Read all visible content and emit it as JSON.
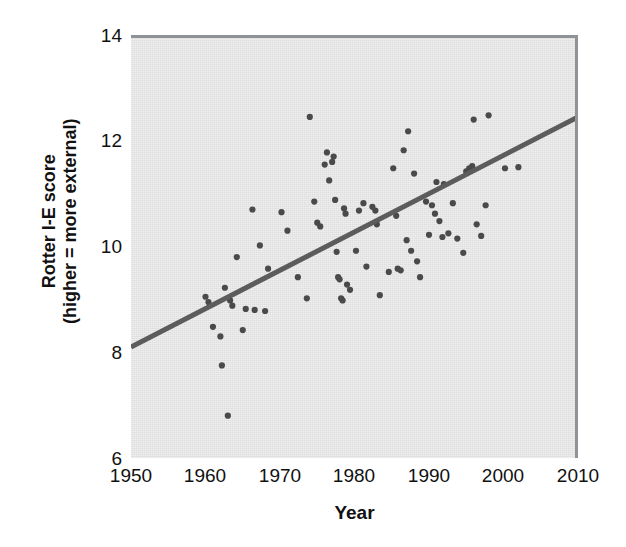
{
  "chart_data": {
    "type": "scatter",
    "title": "",
    "xlabel": "Year",
    "ylabel_line1": "Rotter I-E score",
    "ylabel_line2": "(higher = more external)",
    "xlim": [
      1950,
      2010
    ],
    "ylim": [
      6,
      14
    ],
    "xticks": [
      1950,
      1960,
      1970,
      1980,
      1990,
      2000,
      2010
    ],
    "yticks": [
      6,
      8,
      10,
      12,
      14
    ],
    "grid": false,
    "legend": "none",
    "background_color": "#e7e7e7",
    "point_color": "#4a4a4a",
    "trendline_color": "#5c5c5c",
    "trendline": {
      "type": "linear",
      "x_start": 1950,
      "y_start": 8.1,
      "x_end": 2010,
      "y_end": 12.45
    },
    "series": [
      {
        "name": "Rotter I-E score by year",
        "points": [
          [
            1960.0,
            9.05
          ],
          [
            1960.4,
            8.95
          ],
          [
            1961.0,
            8.48
          ],
          [
            1962.0,
            8.3
          ],
          [
            1962.2,
            7.75
          ],
          [
            1962.6,
            9.22
          ],
          [
            1963.0,
            6.8
          ],
          [
            1963.3,
            8.98
          ],
          [
            1963.6,
            8.88
          ],
          [
            1964.2,
            9.8
          ],
          [
            1965.0,
            8.42
          ],
          [
            1965.4,
            8.82
          ],
          [
            1966.3,
            10.7
          ],
          [
            1966.6,
            8.8
          ],
          [
            1967.3,
            10.02
          ],
          [
            1968.0,
            8.78
          ],
          [
            1968.4,
            9.58
          ],
          [
            1970.2,
            10.65
          ],
          [
            1971.0,
            10.3
          ],
          [
            1972.4,
            9.42
          ],
          [
            1973.6,
            9.02
          ],
          [
            1974.0,
            12.45
          ],
          [
            1974.6,
            10.85
          ],
          [
            1975.0,
            10.45
          ],
          [
            1975.4,
            10.38
          ],
          [
            1976.0,
            11.55
          ],
          [
            1976.3,
            11.78
          ],
          [
            1976.6,
            11.25
          ],
          [
            1977.0,
            11.6
          ],
          [
            1977.2,
            11.7
          ],
          [
            1977.4,
            10.88
          ],
          [
            1977.6,
            9.9
          ],
          [
            1977.8,
            9.42
          ],
          [
            1978.0,
            9.38
          ],
          [
            1978.2,
            9.02
          ],
          [
            1978.4,
            8.98
          ],
          [
            1978.6,
            10.72
          ],
          [
            1978.8,
            10.62
          ],
          [
            1979.0,
            9.28
          ],
          [
            1979.4,
            9.18
          ],
          [
            1980.2,
            9.92
          ],
          [
            1980.6,
            10.68
          ],
          [
            1981.2,
            10.82
          ],
          [
            1981.6,
            9.62
          ],
          [
            1982.4,
            10.75
          ],
          [
            1982.8,
            10.68
          ],
          [
            1983.0,
            10.42
          ],
          [
            1983.4,
            9.08
          ],
          [
            1984.6,
            9.52
          ],
          [
            1985.2,
            11.48
          ],
          [
            1985.6,
            10.58
          ],
          [
            1985.8,
            9.58
          ],
          [
            1986.2,
            9.55
          ],
          [
            1986.6,
            11.82
          ],
          [
            1987.0,
            10.12
          ],
          [
            1987.2,
            12.18
          ],
          [
            1987.6,
            9.92
          ],
          [
            1988.0,
            11.38
          ],
          [
            1988.4,
            9.72
          ],
          [
            1988.8,
            9.42
          ],
          [
            1989.6,
            10.85
          ],
          [
            1990.0,
            10.22
          ],
          [
            1990.4,
            10.78
          ],
          [
            1990.8,
            10.62
          ],
          [
            1991.0,
            11.22
          ],
          [
            1991.4,
            10.48
          ],
          [
            1991.8,
            10.18
          ],
          [
            1992.0,
            11.18
          ],
          [
            1992.6,
            10.25
          ],
          [
            1993.2,
            10.82
          ],
          [
            1993.8,
            10.15
          ],
          [
            1994.6,
            9.88
          ],
          [
            1995.0,
            11.42
          ],
          [
            1995.4,
            11.48
          ],
          [
            1995.8,
            11.52
          ],
          [
            1996.0,
            12.4
          ],
          [
            1996.4,
            10.42
          ],
          [
            1997.0,
            10.2
          ],
          [
            1997.6,
            10.78
          ],
          [
            1998.0,
            12.48
          ],
          [
            2000.2,
            11.48
          ],
          [
            2002.0,
            11.5
          ]
        ]
      }
    ]
  },
  "axes": {
    "y_ticks": [
      "14",
      "12",
      "10",
      "8",
      "6"
    ],
    "x_ticks": [
      "1950",
      "1960",
      "1970",
      "1980",
      "1990",
      "2000",
      "2010"
    ],
    "x_title": "Year",
    "y_title_line1": "Rotter I-E score",
    "y_title_line2": "(higher = more external)"
  }
}
